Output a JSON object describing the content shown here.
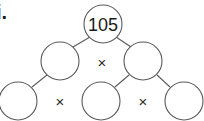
{
  "problem_label": "i.",
  "factor_tree": {
    "root": {
      "value": "105",
      "cx": 103,
      "cy": 24,
      "r": 19
    },
    "level2": [
      {
        "value": "",
        "cx": 60,
        "cy": 61,
        "r": 19
      },
      {
        "value": "",
        "cx": 143,
        "cy": 61,
        "r": 19
      }
    ],
    "level3": [
      {
        "value": "",
        "cx": 18,
        "cy": 101,
        "r": 19
      },
      {
        "value": "",
        "cx": 101,
        "cy": 101,
        "r": 19
      },
      {
        "value": "",
        "cx": 184,
        "cy": 101,
        "r": 19
      }
    ],
    "operators": [
      {
        "symbol": "×",
        "x": 102,
        "y": 62
      },
      {
        "symbol": "×",
        "x": 60,
        "y": 101
      },
      {
        "symbol": "×",
        "x": 143,
        "y": 101
      }
    ],
    "edges": [
      {
        "x1": 90,
        "y1": 37,
        "x2": 73,
        "y2": 47
      },
      {
        "x1": 116,
        "y1": 37,
        "x2": 131,
        "y2": 47
      },
      {
        "x1": 47,
        "y1": 75,
        "x2": 32,
        "y2": 87
      },
      {
        "x1": 129,
        "y1": 75,
        "x2": 115,
        "y2": 87
      },
      {
        "x1": 157,
        "y1": 75,
        "x2": 170,
        "y2": 87
      }
    ]
  },
  "colors": {
    "stroke": "#5a5a5a",
    "text": "#1a1a1a",
    "background": "#ffffff"
  }
}
